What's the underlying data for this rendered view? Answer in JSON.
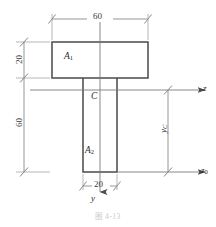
{
  "figure": {
    "caption": "图 4-13"
  },
  "dimensions": {
    "flange_width": "60",
    "flange_thickness": "20",
    "web_height": "60",
    "web_width": "20"
  },
  "labels": {
    "area_top": "A",
    "area_top_sub": "1",
    "area_bottom": "A",
    "area_bottom_sub": "2",
    "centroid": "C",
    "axis_z": "z",
    "axis_z0": "z",
    "axis_z0_sub": "0",
    "axis_y": "y",
    "centroid_distance": "y",
    "centroid_distance_sub": "C"
  },
  "colors": {
    "outline": "#4a4a4a",
    "thin_line": "#8a8a8a",
    "text": "#2b2b2b",
    "background": "#ffffff"
  },
  "geometry": {
    "flange": {
      "x": 52,
      "y": 42,
      "width": 96,
      "height": 36
    },
    "web": {
      "x": 83,
      "y": 78,
      "width": 34,
      "height": 94
    },
    "axis_z_y": 90,
    "axis_z0_y": 172,
    "axis_y_x": 100
  }
}
